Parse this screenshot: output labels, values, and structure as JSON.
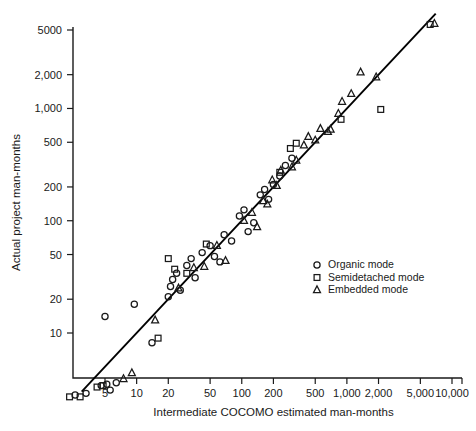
{
  "chart_data": {
    "type": "scatter",
    "title": "",
    "xlabel": "Intermediate COCOMO estimated man-months",
    "ylabel": "Actual project man-months",
    "xscale": "log",
    "yscale": "log",
    "grid": false,
    "xlim": [
      2,
      14000
    ],
    "ylim": [
      2,
      7000
    ],
    "xticks": [
      5,
      10,
      20,
      50,
      100,
      200,
      500,
      1000,
      2000,
      5000,
      10000
    ],
    "xtick_labels": [
      "5",
      "10",
      "20",
      "50",
      "100",
      "200",
      "500",
      "1,000",
      "2,000",
      "5,000",
      "10,000"
    ],
    "yticks": [
      10,
      20,
      50,
      100,
      200,
      500,
      1000,
      2000,
      5000
    ],
    "ytick_labels": [
      "10",
      "20",
      "50",
      "100",
      "200",
      "500",
      "1,000",
      "2,000",
      "5000"
    ],
    "legend_position": "center-right",
    "reference_line": {
      "label": "y = x",
      "x": [
        3.0,
        7000
      ],
      "y": [
        3.0,
        7000
      ]
    },
    "series": [
      {
        "name": "Organic mode",
        "marker": "circle",
        "legend_label": "Organic mode",
        "points": [
          [
            2.6,
            2.8
          ],
          [
            3.3,
            2.9
          ],
          [
            4.6,
            3.4
          ],
          [
            5.2,
            3.5
          ],
          [
            5.6,
            3.1
          ],
          [
            6.4,
            3.6
          ],
          [
            5.0,
            14.0
          ],
          [
            9.5,
            18.0
          ],
          [
            14.0,
            8.2
          ],
          [
            20.0,
            21.0
          ],
          [
            21.0,
            26.0
          ],
          [
            22.0,
            30.0
          ],
          [
            24.0,
            34.0
          ],
          [
            26.0,
            24.0
          ],
          [
            30.0,
            40.0
          ],
          [
            33.0,
            46.0
          ],
          [
            36.0,
            31.0
          ],
          [
            42.0,
            52.0
          ],
          [
            50.0,
            60.0
          ],
          [
            55.0,
            48.0
          ],
          [
            62.0,
            43.0
          ],
          [
            68.0,
            75.0
          ],
          [
            80.0,
            66.0
          ],
          [
            95.0,
            110.0
          ],
          [
            105.0,
            125.0
          ],
          [
            115.0,
            80.0
          ],
          [
            130.0,
            96.0
          ],
          [
            150.0,
            170.0
          ],
          [
            165.0,
            190.0
          ],
          [
            180.0,
            155.0
          ],
          [
            200.0,
            210.0
          ],
          [
            230.0,
            250.0
          ],
          [
            260.0,
            310.0
          ],
          [
            300.0,
            360.0
          ]
        ]
      },
      {
        "name": "Semidetached mode",
        "marker": "square",
        "legend_label": "Semidetached mode",
        "points": [
          [
            2.3,
            2.7
          ],
          [
            2.9,
            2.7
          ],
          [
            4.2,
            3.3
          ],
          [
            4.8,
            3.4
          ],
          [
            16.0,
            9.0
          ],
          [
            20.0,
            46.0
          ],
          [
            23.0,
            37.0
          ],
          [
            30.0,
            34.0
          ],
          [
            46.0,
            62.0
          ],
          [
            230.0,
            270.0
          ],
          [
            290.0,
            440.0
          ],
          [
            330.0,
            490.0
          ],
          [
            880.0,
            800.0
          ],
          [
            2100.0,
            980.0
          ],
          [
            6200.0,
            5600.0
          ]
        ]
      },
      {
        "name": "Embedded mode",
        "marker": "triangle",
        "legend_label": "Embedded mode",
        "points": [
          [
            7.5,
            3.9
          ],
          [
            9.0,
            4.4
          ],
          [
            15.0,
            13.0
          ],
          [
            25.0,
            25.0
          ],
          [
            35.0,
            38.0
          ],
          [
            44.0,
            39.0
          ],
          [
            58.0,
            60.0
          ],
          [
            70.0,
            44.0
          ],
          [
            105.0,
            100.0
          ],
          [
            125.0,
            118.0
          ],
          [
            140.0,
            88.0
          ],
          [
            160.0,
            150.0
          ],
          [
            175.0,
            140.0
          ],
          [
            195.0,
            230.0
          ],
          [
            215.0,
            205.0
          ],
          [
            235.0,
            280.0
          ],
          [
            300.0,
            300.0
          ],
          [
            330.0,
            345.0
          ],
          [
            390.0,
            470.0
          ],
          [
            430.0,
            560.0
          ],
          [
            500.0,
            520.0
          ],
          [
            560.0,
            660.0
          ],
          [
            660.0,
            620.0
          ],
          [
            700.0,
            650.0
          ],
          [
            830.0,
            900.0
          ],
          [
            900.0,
            1150.0
          ],
          [
            1100.0,
            1350.0
          ],
          [
            1350.0,
            2100.0
          ],
          [
            1900.0,
            1900.0
          ],
          [
            6800.0,
            5700.0
          ]
        ]
      }
    ]
  },
  "legend": {
    "entries": [
      {
        "marker": "circle",
        "label": "Organic mode"
      },
      {
        "marker": "square",
        "label": "Semidetached mode"
      },
      {
        "marker": "triangle",
        "label": "Embedded mode"
      }
    ]
  },
  "colors": {
    "axis": "#1a1a1a",
    "line": "#000000",
    "marker_stroke": "#1a1a1a",
    "background": "#ffffff"
  }
}
